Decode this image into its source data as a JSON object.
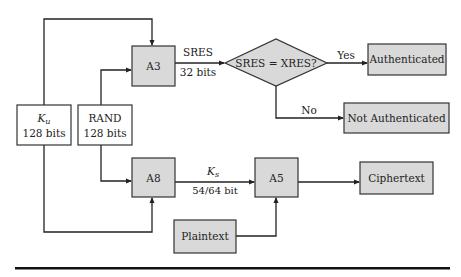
{
  "diagram": {
    "type": "flowchart",
    "nodes": {
      "ku": {
        "line1": "K",
        "line1_sub": "u",
        "line2": "128 bits"
      },
      "rand": {
        "line1": "RAND",
        "line2": "128 bits"
      },
      "a3": {
        "label": "A3"
      },
      "a8": {
        "label": "A8"
      },
      "a5": {
        "label": "A5"
      },
      "decision": {
        "label": "SRES = XRES?"
      },
      "authenticated": {
        "label": "Authenticated"
      },
      "not_authenticated": {
        "label": "Not Authenticated"
      },
      "ciphertext": {
        "label": "Ciphertext"
      },
      "plaintext": {
        "label": "Plaintext"
      }
    },
    "edges": {
      "sres": {
        "line1": "SRES",
        "line2": "32 bits"
      },
      "ks": {
        "line1": "K",
        "line1_sub": "s",
        "line2": "54/64 bit"
      },
      "yes": {
        "label": "Yes"
      },
      "no": {
        "label": "No"
      }
    },
    "colors": {
      "box_fill": "#d9d9d9",
      "stroke": "#222222",
      "background": "#ffffff"
    }
  }
}
